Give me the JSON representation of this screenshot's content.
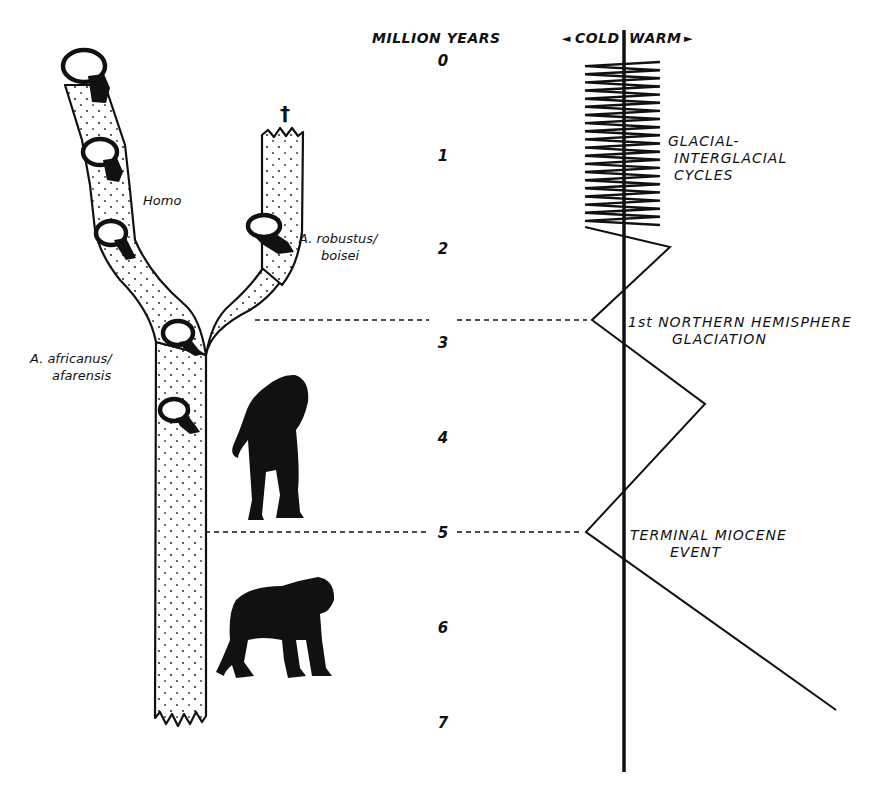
{
  "figure": {
    "type": "hominid phylogeny vs. paleoclimate timeline",
    "background": "#ffffff",
    "ink": "#111111"
  },
  "timescale": {
    "header": "MILLION YEARS",
    "ticks": [
      {
        "label": "0",
        "y": 60
      },
      {
        "label": "1",
        "y": 155
      },
      {
        "label": "2",
        "y": 248
      },
      {
        "label": "3",
        "y": 342
      },
      {
        "label": "4",
        "y": 437
      },
      {
        "label": "5",
        "y": 532
      },
      {
        "label": "6",
        "y": 627
      },
      {
        "label": "7",
        "y": 722
      }
    ],
    "x": 443
  },
  "climate_axis": {
    "cold_label": "COLD",
    "warm_label": "WARM",
    "cold_arrow": "◄",
    "warm_arrow": "►",
    "axis_x": 624,
    "axis_top": 30,
    "axis_bottom": 772
  },
  "climate_curve": {
    "cycles_region": {
      "top": 62,
      "bottom": 225,
      "cold_x": 585,
      "warm_x": 660,
      "count": 20
    },
    "points": [
      [
        585,
        227
      ],
      [
        670,
        247
      ],
      [
        592,
        320
      ],
      [
        705,
        404
      ],
      [
        586,
        532
      ],
      [
        836,
        710
      ]
    ]
  },
  "climate_events": [
    {
      "id": "glacial-cycles",
      "lines": [
        "GLACIAL-",
        "INTERGLACIAL",
        "CYCLES"
      ],
      "x": 668,
      "y": 146
    },
    {
      "id": "northern-glaciation",
      "lines": [
        "1st NORTHERN HEMISPHERE",
        "GLACIATION"
      ],
      "x": 628,
      "y": 327
    },
    {
      "id": "terminal-miocene",
      "lines": [
        "TERMINAL MIOCENE",
        "EVENT"
      ],
      "x": 630,
      "y": 540
    }
  ],
  "links": [
    {
      "id": "link-3ma",
      "x1": 255,
      "x2": 587,
      "y": 320
    },
    {
      "id": "link-5ma",
      "x1": 205,
      "x2": 582,
      "y": 532
    }
  ],
  "taxa": [
    {
      "id": "homo",
      "label": "Homo",
      "x": 143,
      "y": 205
    },
    {
      "id": "robustus",
      "lines": [
        "A. robustus/",
        "boisei"
      ],
      "x": 299,
      "y": 243
    },
    {
      "id": "africanus",
      "lines": [
        "A. africanus/",
        "afarensis"
      ],
      "x": 30,
      "y": 363
    }
  ],
  "extinction_marker": {
    "glyph": "†",
    "x": 285,
    "y": 120
  }
}
